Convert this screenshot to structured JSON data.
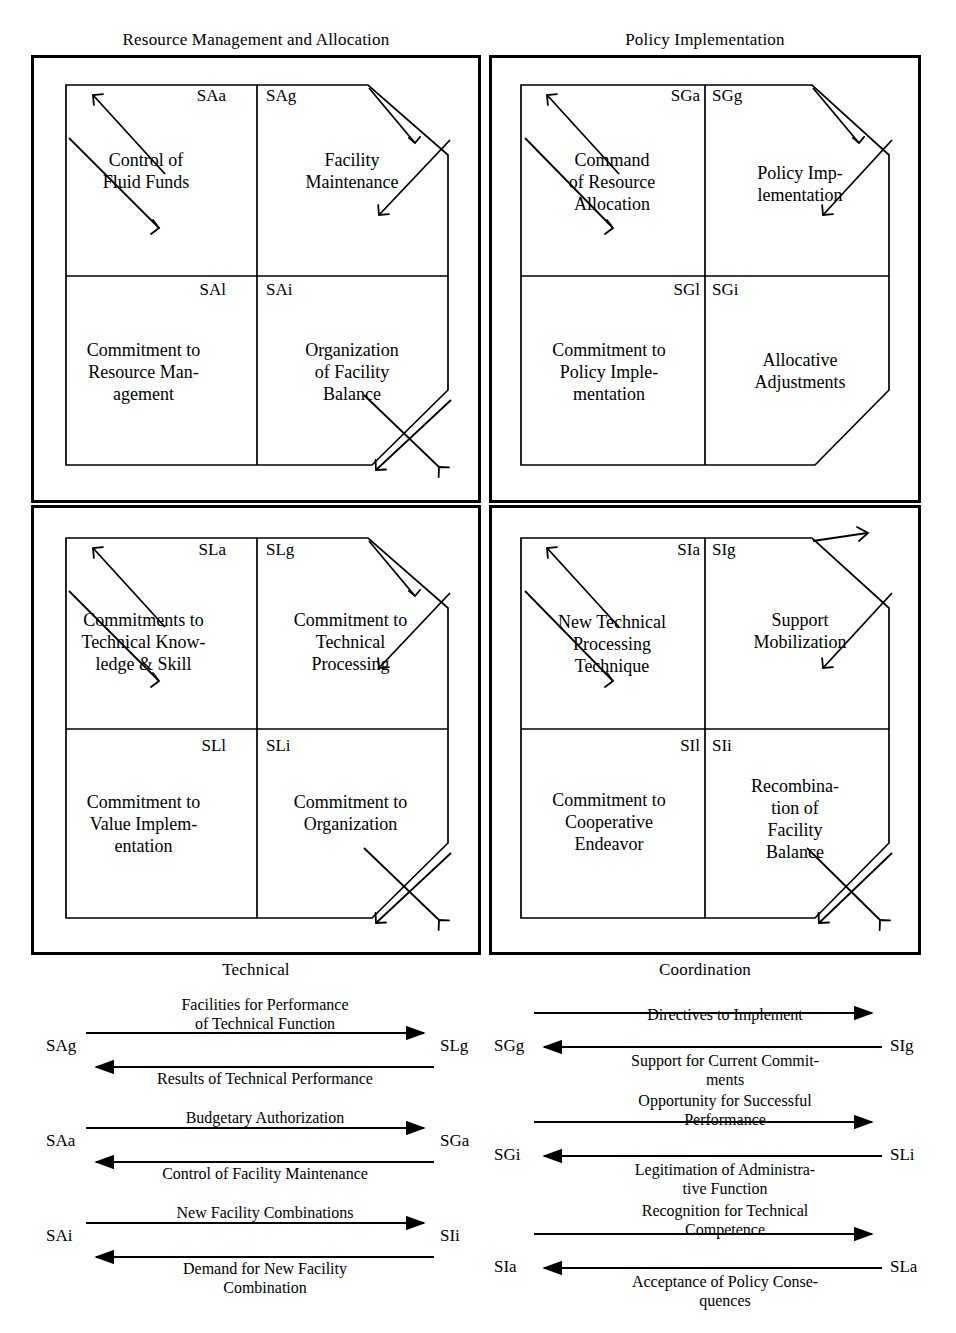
{
  "figure": {
    "type": "four-function AGIL paradigm diagram with exchange flows",
    "quadrant_captions": {
      "top_left": "Resource Management and Allocation",
      "top_right": "Policy Implementation",
      "bottom_left": "Technical",
      "bottom_right": "Coordination"
    }
  },
  "quadrants": [
    {
      "id": "resource-management-and-allocation",
      "caption": "Resource Management and Allocation",
      "caption_position": "top",
      "cells": [
        {
          "code": "SAa",
          "code_align": "right",
          "text": "Control of\nFluid Funds",
          "position": "upper-left"
        },
        {
          "code": "SAg",
          "code_align": "left",
          "text": "Facility\nMaintenance",
          "position": "upper-right"
        },
        {
          "code": "SAl",
          "code_align": "right",
          "text": "Commitment to\nResource Man-\nagement",
          "position": "lower-left"
        },
        {
          "code": "SAi",
          "code_align": "left",
          "text": "Organization\nof Facility\nBalance",
          "position": "lower-right"
        }
      ]
    },
    {
      "id": "policy-implementation",
      "caption": "Policy Implementation",
      "caption_position": "top",
      "cells": [
        {
          "code": "SGa",
          "code_align": "right",
          "text": "Command\nof Resource\nAllocation",
          "position": "upper-left"
        },
        {
          "code": "SGg",
          "code_align": "left",
          "text": "Policy Imp-\nlementation",
          "position": "upper-right"
        },
        {
          "code": "SGl",
          "code_align": "right",
          "text": "Commitment to\nPolicy Imple-\nmentation",
          "position": "lower-left"
        },
        {
          "code": "SGi",
          "code_align": "left",
          "text": "Allocative\nAdjustments",
          "position": "lower-right"
        }
      ]
    },
    {
      "id": "technical",
      "caption": "Technical",
      "caption_position": "bottom",
      "cells": [
        {
          "code": "SLa",
          "code_align": "right",
          "text": "Commitments to\nTechnical Know-\nledge & Skill",
          "position": "upper-left"
        },
        {
          "code": "SLg",
          "code_align": "left",
          "text": "Commitment to\nTechnical\nProcessing",
          "position": "upper-right"
        },
        {
          "code": "SLl",
          "code_align": "right",
          "text": "Commitment to\nValue Implem-\nentation",
          "position": "lower-left"
        },
        {
          "code": "SLi",
          "code_align": "left",
          "text": "Commitment to\nOrganization",
          "position": "lower-right"
        }
      ]
    },
    {
      "id": "coordination",
      "caption": "Coordination",
      "caption_position": "bottom",
      "cells": [
        {
          "code": "SIa",
          "code_align": "right",
          "text": "New Technical\nProcessing\nTechnique",
          "position": "upper-left"
        },
        {
          "code": "SIg",
          "code_align": "left",
          "text": "Support\nMobilization",
          "position": "upper-right"
        },
        {
          "code": "SIl",
          "code_align": "right",
          "text": "Commitment to\nCooperative\nEndeavor",
          "position": "lower-left"
        },
        {
          "code": "SIi",
          "code_align": "left",
          "text": "Recombina-\ntion of\nFacility\nBalance",
          "position": "lower-right"
        }
      ]
    }
  ],
  "exchanges": {
    "left_column": [
      {
        "from": "SAg",
        "to": "SLg",
        "forward_label": "Facilities for Performance\nof Technical Function",
        "backward_label": "Results of Technical Performance"
      },
      {
        "from": "SAa",
        "to": "SGa",
        "forward_label": "Budgetary Authorization",
        "backward_label": "Control of Facility Maintenance"
      },
      {
        "from": "SAi",
        "to": "SIi",
        "forward_label": "New Facility Combinations",
        "backward_label": "Demand for New Facility\nCombination"
      }
    ],
    "right_column": [
      {
        "from": "SGg",
        "to": "SIg",
        "forward_label": "Directives to Implement",
        "backward_label": "Support for Current Commit-\nments"
      },
      {
        "from": "SGi",
        "to": "SLi",
        "forward_label": "Opportunity for Successful\nPerformance",
        "backward_label": "Legitimation of Administra-\ntive Function"
      },
      {
        "from": "SIa",
        "to": "SLa",
        "forward_label": "Recognition for Technical\nCompetence",
        "backward_label": "Acceptance of Policy Conse-\nquences"
      }
    ]
  },
  "colors": {
    "ink": "#000000",
    "paper": "#ffffff"
  }
}
